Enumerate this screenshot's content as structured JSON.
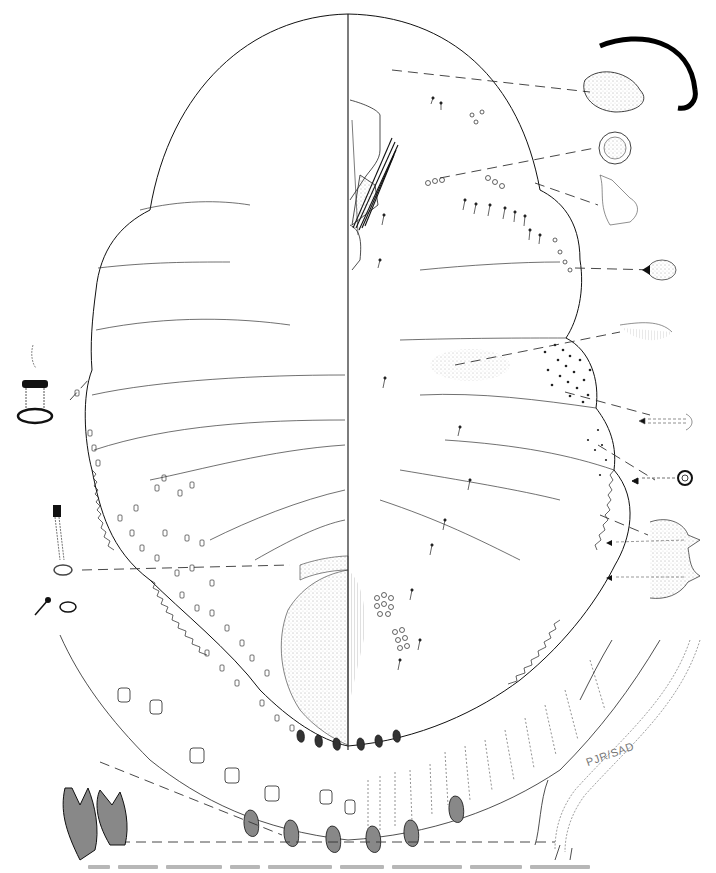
{
  "figure": {
    "type": "scientific-illustration",
    "signature": "PJR/SAD",
    "caption_visible": false,
    "caption_note": "caption line cropped at bottom edge, illegible",
    "colors": {
      "ink": "#111111",
      "stipple": "#555555",
      "leader": "#333333",
      "background": "#ffffff"
    },
    "insets": [
      {
        "name": "claw-detail",
        "side": "right",
        "position": "upper-right"
      },
      {
        "name": "spiracle-pore-detail",
        "side": "right",
        "position": "upper-right"
      },
      {
        "name": "antenna-segment-detail",
        "side": "right",
        "position": "right"
      },
      {
        "name": "stigmatic-seta-detail",
        "side": "right",
        "position": "right"
      },
      {
        "name": "tubular-duct-detail",
        "side": "right",
        "position": "right"
      },
      {
        "name": "setae-pair-detail",
        "side": "right",
        "position": "right"
      },
      {
        "name": "disc-pore-detail",
        "side": "right",
        "position": "right"
      },
      {
        "name": "anal-lobe-detail",
        "side": "right",
        "position": "lower-right"
      },
      {
        "name": "dorsal-duct-detail",
        "side": "left",
        "position": "left"
      },
      {
        "name": "marginal-duct-detail",
        "side": "left",
        "position": "left"
      },
      {
        "name": "marginal-spine-detail",
        "side": "left",
        "position": "lower-left"
      }
    ]
  }
}
